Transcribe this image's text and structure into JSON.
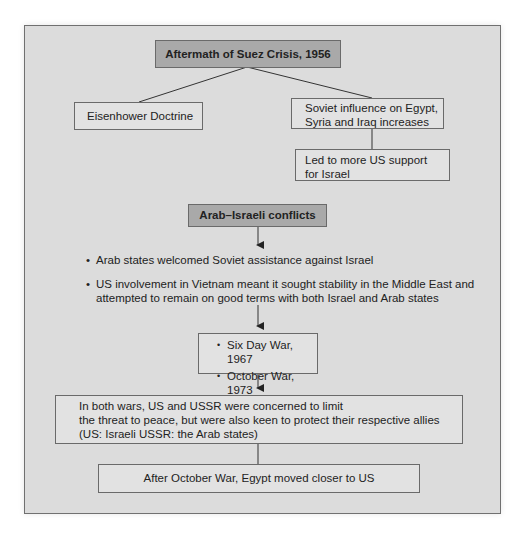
{
  "diagram": {
    "title": "Aftermath of Suez Crisis, 1956",
    "branches": {
      "left": "Eisenhower Doctrine",
      "right": [
        "Soviet influence on Egypt,",
        "Syria and Iraq increases"
      ],
      "right_child": [
        "Led to more US support",
        "for Israel"
      ]
    },
    "section2_title": "Arab–Israeli conflicts",
    "bullets": [
      "Arab states welcomed Soviet assistance against Israel",
      "US involvement in Vietnam meant it sought stability in the Middle East and",
      "attempted to remain on good terms with both Israel and Arab states"
    ],
    "wars": [
      "Six Day War, 1967",
      "October War, 1973"
    ],
    "both_wars": [
      "In both wars, US and USSR were concerned to limit",
      "the threat to peace, but were also keen to protect their respective allies",
      "(US: Israeli USSR: the Arab states)"
    ],
    "final": "After October War, Egypt moved closer to US"
  },
  "colors": {
    "panel_bg": "#dcdcdc",
    "header_box": "#a9a9a9",
    "box_bg": "#e2e2e2",
    "border": "#6a6a6a"
  }
}
